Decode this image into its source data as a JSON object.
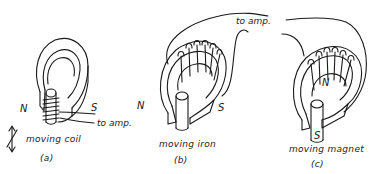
{
  "figure": {
    "panels": [
      {
        "id": "a",
        "caption": "moving coil",
        "letter": "(a)",
        "pole_left": "N",
        "pole_right": "S",
        "lead_label": "to amp."
      },
      {
        "id": "b",
        "caption": "moving iron",
        "letter": "(b)",
        "pole_left": "N",
        "pole_right": "S"
      },
      {
        "id": "c",
        "caption": "moving magnet",
        "letter": "(c)",
        "pole_top": "N",
        "pole_bottom": "S",
        "lead_label": "to amp."
      }
    ],
    "colors": {
      "ink": "#1a1a1a",
      "background": "#ffffff"
    }
  }
}
